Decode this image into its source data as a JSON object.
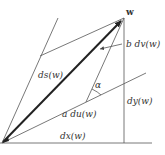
{
  "diagram": {
    "type": "vector-decomposition",
    "colors": {
      "line": "#555555",
      "vector": "#222222",
      "text": "#333333",
      "background": "#ffffff"
    },
    "labels": {
      "point_w": "w",
      "ds": "ds(w)",
      "b_dv": "b dv(w)",
      "alpha": "α",
      "dy": "dy(w)",
      "a_du": "a du(w)",
      "dx": "dx(w)"
    }
  }
}
